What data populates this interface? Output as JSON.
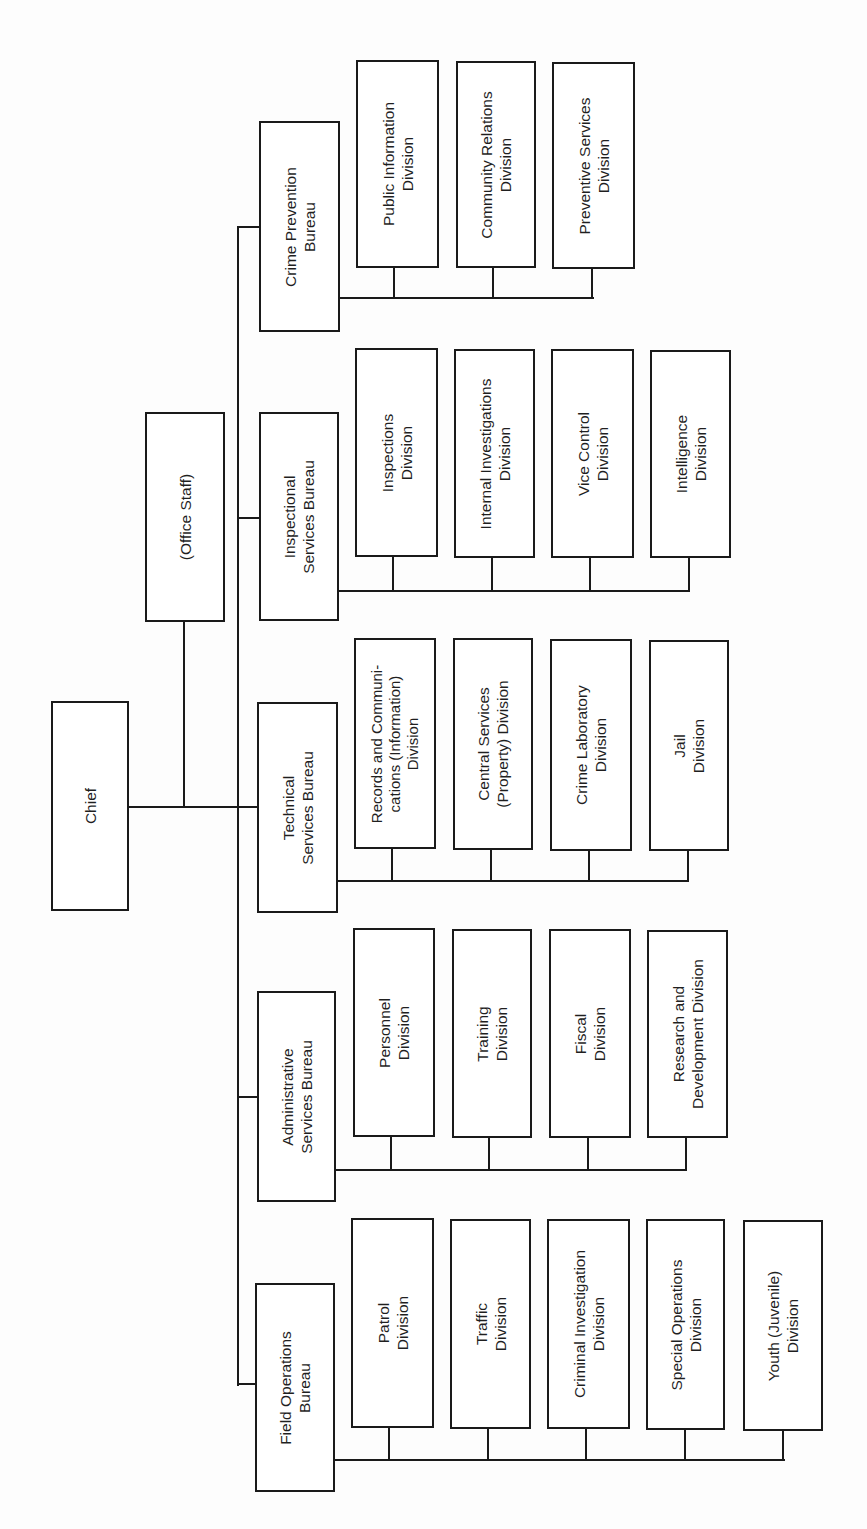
{
  "chart_title": "",
  "chief": {
    "label": "Chief"
  },
  "office_staff": {
    "label": "(Office Staff)"
  },
  "bureaus": [
    {
      "label": "Crime Prevention\nBureau",
      "divisions": [
        "Public Information\nDivision",
        "Community Relations\nDivision",
        "Preventive Services\nDivision"
      ]
    },
    {
      "label": "Inspectional\nServices Bureau",
      "divisions": [
        "Inspections\nDivision",
        "Internal Investigations\nDivision",
        "Vice Control\nDivision",
        "Intelligence\nDivision"
      ]
    },
    {
      "label": "Technical\nServices Bureau",
      "divisions": [
        "Records and Communi-\ncations (Information)\nDivision",
        "Central Services\n(Property) Division",
        "Crime Laboratory\nDivision",
        "Jail\nDivision"
      ]
    },
    {
      "label": "Administrative\nServices Bureau",
      "divisions": [
        "Personnel\nDivision",
        "Training\nDivision",
        "Fiscal\nDivision",
        "Research and\nDevelopment Division"
      ]
    },
    {
      "label": "Field Operations\nBureau",
      "divisions": [
        "Patrol\nDivision",
        "Traffic\nDivision",
        "Criminal Investigation\nDivision",
        "Special Operations\nDivision",
        "Youth (Juvenile)\nDivision"
      ]
    }
  ],
  "colors": {
    "line": "#1a1a1a",
    "box_fill": "#ffffff",
    "background": "#fdfdfd"
  }
}
